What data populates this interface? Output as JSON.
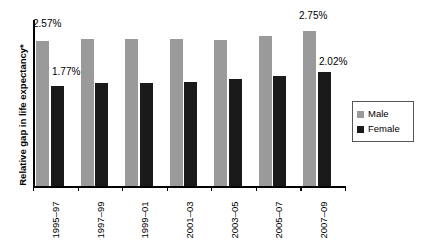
{
  "chart_data": {
    "type": "bar",
    "title": "",
    "xlabel": "",
    "ylabel": "Relative gap in life expectancy*",
    "categories": [
      "1995–97",
      "1997–99",
      "1999–01",
      "2001–03",
      "2003–05",
      "2005–07",
      "2007–09"
    ],
    "series": [
      {
        "name": "Male",
        "color": "#9a9a9a",
        "values": [
          2.57,
          2.62,
          2.61,
          2.61,
          2.6,
          2.67,
          2.75
        ],
        "unit": "%"
      },
      {
        "name": "Female",
        "color": "#1a1a1a",
        "values": [
          1.77,
          1.83,
          1.83,
          1.85,
          1.9,
          1.95,
          2.02
        ],
        "unit": "%"
      }
    ],
    "ylim": [
      0,
      2.95
    ],
    "grid": false,
    "legend_position": "right",
    "annotations": [
      {
        "text": "2.57%",
        "series": "Male",
        "category": "1995–97"
      },
      {
        "text": "1.77%",
        "series": "Female",
        "category": "1995–97"
      },
      {
        "text": "2.75%",
        "series": "Male",
        "category": "2007–09"
      },
      {
        "text": "2.02%",
        "series": "Female",
        "category": "2007–09"
      }
    ]
  },
  "legend": {
    "items": [
      {
        "label": "Male",
        "color": "#9a9a9a"
      },
      {
        "label": "Female",
        "color": "#1a1a1a"
      }
    ]
  },
  "labels": {
    "male_first": "2.57%",
    "female_first": "1.77%",
    "male_last": "2.75%",
    "female_last": "2.02%"
  }
}
